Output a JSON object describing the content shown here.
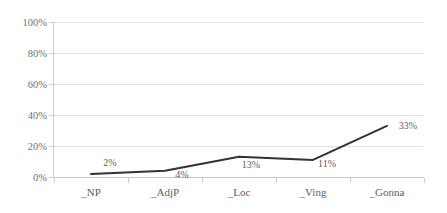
{
  "chart_data": {
    "type": "line",
    "title": "",
    "subtitle": "",
    "xlabel": "",
    "ylabel": "",
    "categories": [
      "_NP",
      "_AdjP",
      "_Loc",
      "_Ving",
      "_Gonna"
    ],
    "values": [
      2,
      4,
      13,
      11,
      33
    ],
    "value_labels": [
      "2%",
      "4%",
      "13%",
      "11%",
      "33%"
    ],
    "ylim": [
      0,
      100
    ],
    "y_ticks": [
      0,
      20,
      40,
      60,
      80,
      100
    ],
    "y_tick_labels": [
      "0%",
      "20%",
      "40%",
      "60%",
      "80%",
      "100%"
    ],
    "grid": true,
    "grid_axis": "y",
    "legend": false,
    "legend_position": "none",
    "series": [
      {
        "name": "",
        "values": [
          2,
          4,
          13,
          11,
          33
        ],
        "color": "#333333",
        "line_width": 2,
        "markers": false
      }
    ],
    "colors": {
      "line": "#333333",
      "gridline": "#e2e2e2",
      "axis": "#cfcfcf",
      "tick_text": "#6f6f6f",
      "label_text": "#5d5d5d",
      "background": "#ffffff"
    }
  },
  "axis": {
    "y_labels": [
      "100%",
      "80%",
      "60%",
      "40%",
      "20%",
      "0%"
    ],
    "x_labels": [
      "_NP",
      "_AdjP",
      "_Loc",
      "_Ving",
      "_Gonna"
    ]
  },
  "data_labels": [
    {
      "text": "2%",
      "value": 2
    },
    {
      "text": "4%",
      "value": 4
    },
    {
      "text": "13%",
      "value": 13
    },
    {
      "text": "11%",
      "value": 11
    },
    {
      "text": "33%",
      "value": 33
    }
  ]
}
